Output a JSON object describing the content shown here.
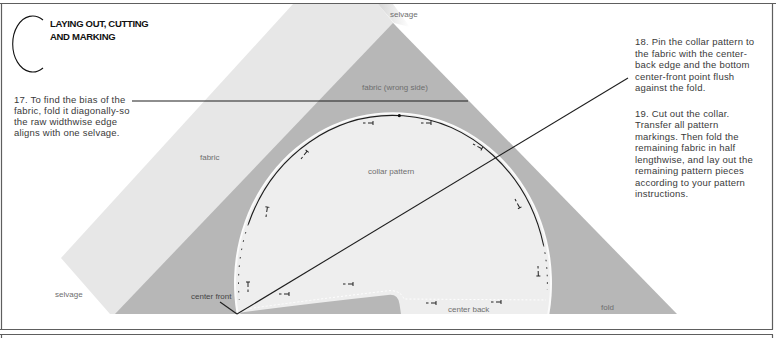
{
  "title": {
    "section_letter": "C",
    "lines": [
      "LAYING OUT, CUTTING",
      "AND MARKING"
    ]
  },
  "steps": {
    "step17": {
      "lines": [
        "17. To find the bias of the",
        "fabric, fold it diagonally-so",
        "the raw widthwise edge",
        "aligns with one selvage."
      ]
    },
    "step18": {
      "lines": [
        "18. Pin the collar pattern to",
        "the fabric with the center-",
        "back edge and the bottom",
        "center-front point flush",
        "against the fold."
      ]
    },
    "step19": {
      "lines": [
        "19. Cut out the collar.",
        "Transfer all pattern",
        "markings. Then fold the",
        "remaining fabric in half",
        "lengthwise, and lay out the",
        "remaining pattern pieces",
        "according to your pattern",
        "instructions."
      ]
    }
  },
  "diagram": {
    "labels": {
      "selvage_top": "selvage",
      "fabric_wrong_side": "fabric (wrong side)",
      "fabric": "fabric",
      "collar_pattern": "collar pattern",
      "selvage_bottom": "selvage",
      "center_front": "center front",
      "center_back": "center back",
      "fold": "fold"
    },
    "colors": {
      "fabric_right_side": "#e7e7e7",
      "fabric_wrong_side": "#b7b7b7",
      "collar_rim": "#fbfbfb",
      "collar_fill": "#eeeeee",
      "line": "#1e1e1e",
      "frame": "#5e5e5e"
    }
  }
}
